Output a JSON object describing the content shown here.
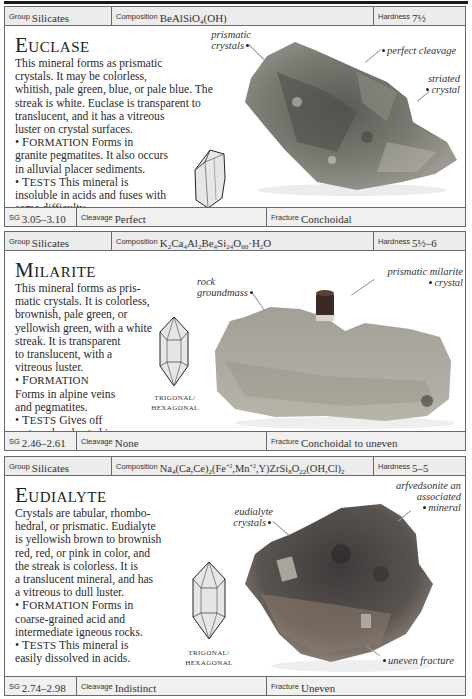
{
  "minerals": [
    {
      "name": "Euclase",
      "name_cap": "E",
      "name_rest": "UCLASE",
      "group_label": "Group",
      "group": "Silicates",
      "composition_label": "Composition",
      "composition": "BeAlSiO4(OH)",
      "hardness_label": "Hardness",
      "hardness": "7½",
      "description": [
        "This mineral forms as prismatic",
        "crystals. It may be colorless,",
        "whitish, pale green, blue, or pale blue. The",
        "streak is white. Euclase is transparent to",
        "translucent, and it has a vitreous",
        "luster on crystal surfaces."
      ],
      "formation_heading": "FORMATION",
      "formation": [
        "Forms in",
        "granite pegmatites. It also occurs",
        "in alluvial placer sediments."
      ],
      "tests_heading": "TESTS",
      "tests": [
        "This mineral is",
        "insoluble in acids and fuses with",
        "some difficulty."
      ],
      "crystal_system": [
        "MONOCLINIC"
      ],
      "annotations": [
        "prismatic crystals",
        "perfect cleavage",
        "striated crystal"
      ],
      "sg_label": "SG",
      "sg": "3.05–3.10",
      "cleavage_label": "Cleavage",
      "cleavage": "Perfect",
      "fracture_label": "Fracture",
      "fracture": "Conchoidal"
    },
    {
      "name": "Milarite",
      "name_cap": "M",
      "name_rest": "ILARITE",
      "group_label": "Group",
      "group": "Silicates",
      "composition_label": "Composition",
      "composition": "K2Ca4Al2Be4Si24O60·H2O",
      "hardness_label": "Hardness",
      "hardness": "5½–6",
      "description": [
        "This mineral forms as pris-",
        "matic crystals. It is colorless,",
        "brownish, pale green, or",
        "yellowish green, with a white",
        "streak. It is transparent",
        "to translucent, with a",
        "vitreous luster."
      ],
      "formation_heading": "FORMATION",
      "formation": [
        "Forms in alpine veins",
        "and pegmatites."
      ],
      "tests_heading": "TESTS",
      "tests": [
        "Gives off",
        "water when heated in a",
        "closed test tube."
      ],
      "crystal_system": [
        "TRIGONAL/",
        "HEXAGONAL"
      ],
      "annotations": [
        "rock groundmass",
        "prismatic milarite crystal"
      ],
      "sg_label": "SG",
      "sg": "2.46–2.61",
      "cleavage_label": "Cleavage",
      "cleavage": "None",
      "fracture_label": "Fracture",
      "fracture": "Conchoidal to uneven"
    },
    {
      "name": "Eudialyte",
      "name_cap": "E",
      "name_rest": "UDIALYTE",
      "group_label": "Group",
      "group": "Silicates",
      "composition_label": "Composition",
      "composition": "Na4(Ca,Ce)2(Fe+2,Mn+2,Y)ZrSi8O22(OH,Cl)2",
      "hardness_label": "Hardness",
      "hardness": "5–5",
      "description": [
        "Crystals are tabular, rhombo-",
        "hedral, or prismatic. Eudialyte",
        "is yellowish brown to brownish",
        "red, red, or pink in color, and",
        "the streak is colorless. It is",
        "a translucent mineral, and has",
        "a vitreous to dull luster."
      ],
      "formation_heading": "FORMATION",
      "formation": [
        "Forms in",
        "coarse-grained acid and",
        "intermediate igneous rocks."
      ],
      "tests_heading": "TESTS",
      "tests": [
        "This mineral is",
        "easily dissolved in acids."
      ],
      "crystal_system": [
        "TRIGONAL/",
        "HEXAGONAL"
      ],
      "annotations": [
        "eudialyte crystals",
        "arfvedsonite an associated mineral",
        "uneven fracture"
      ],
      "sg_label": "SG",
      "sg": "2.74–2.98",
      "cleavage_label": "Cleavage",
      "cleavage": "Indistinct",
      "fracture_label": "Fracture",
      "fracture": "Uneven"
    }
  ],
  "colors": {
    "header_bg": "#ececec",
    "border": "#6a6a6a",
    "text": "#222222",
    "rule": "#1a1a1a"
  }
}
